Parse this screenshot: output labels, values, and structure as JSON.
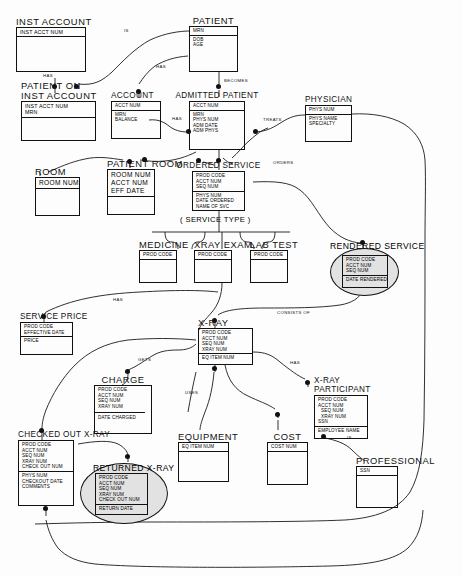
{
  "diagram": {
    "type": "entity-relationship-diagram",
    "service_type_label": "( SERVICE TYPE )"
  },
  "entities": [
    {
      "id": "inst-account",
      "name": "INST ACCOUNT",
      "keys": [
        "INST ACCT NUM"
      ],
      "attributes": []
    },
    {
      "id": "patient-on-inst-account",
      "name": "PATIENT ON INST ACCOUNT",
      "name_line1": "PATIENT ON",
      "name_line2": "INST ACCOUNT",
      "keys": [
        "INST ACCT NUM",
        "MRN"
      ],
      "attributes": []
    },
    {
      "id": "account",
      "name": "ACCOUNT",
      "keys": [
        "ACCT NUM"
      ],
      "attributes": [
        "MRN",
        "BALANCE"
      ]
    },
    {
      "id": "patient",
      "name": "PATIENT",
      "keys": [
        "MRN"
      ],
      "attributes": [
        "DOB",
        "AGE"
      ]
    },
    {
      "id": "admitted-patient",
      "name": "ADMITTED PATIENT",
      "keys": [
        "ACCT NUM"
      ],
      "attributes": [
        "MRN",
        "PHYS NUM",
        "ADM  DATE",
        "ADM  PHYS"
      ]
    },
    {
      "id": "physician",
      "name": "PHYSICIAN",
      "keys": [
        "PHYS NUM"
      ],
      "attributes": [
        "PHYS NAME",
        "SPECIALTY"
      ]
    },
    {
      "id": "room",
      "name": "ROOM",
      "keys": [
        "ROOM  NUM"
      ],
      "attributes": []
    },
    {
      "id": "patient-room",
      "name": "PATIENT ROOM",
      "keys": [
        "ROOM  NUM",
        "ACCT NUM",
        "EFF DATE"
      ],
      "attributes": []
    },
    {
      "id": "ordered-service",
      "name": "ORDERED SERVICE",
      "keys": [
        "PROD CODE",
        "ACCT NUM",
        "SEQ NUM"
      ],
      "attributes": [
        "PHYS NUM",
        "DATE ORDERED",
        "NAME OF SVC"
      ]
    },
    {
      "id": "medicine",
      "name": "MEDICINE",
      "keys": [
        "PROD CODE"
      ],
      "attributes": []
    },
    {
      "id": "xray-exam",
      "name": "XRAY EXAM",
      "keys": [
        "PROD CODE"
      ],
      "attributes": []
    },
    {
      "id": "lab-test",
      "name": "LAB TEST",
      "keys": [
        "PROD CODE"
      ],
      "attributes": []
    },
    {
      "id": "rendered-service",
      "name": "RENDERED SERVICE",
      "keys": [
        "PROD CODE",
        "ACCT NUM",
        "SEQ NUM"
      ],
      "attributes": [
        "DATE RENDERED"
      ],
      "shape": "oval"
    },
    {
      "id": "service-price",
      "name": "SERVICE  PRICE",
      "keys": [
        "PROD CODE",
        "EFFECTIVE DATE"
      ],
      "attributes": [
        "PRICE"
      ]
    },
    {
      "id": "charge",
      "name": "CHARGE",
      "keys": [
        "PROD CODE",
        "ACCT NUM",
        "SEQ NUM",
        "XRAY  NUM"
      ],
      "attributes": [
        "DATE CHARGED"
      ]
    },
    {
      "id": "xray",
      "name": "X-RAY",
      "keys": [
        "PROD CODE",
        "ACCT NUM",
        "SEQ NUM",
        "XRAY  NUM"
      ],
      "attributes": [
        "EQ ITEM NUM"
      ]
    },
    {
      "id": "xray-participant",
      "name": "X-RAY PARTICIPANT",
      "name_line1": "X-RAY",
      "name_line2": "PARTICIPANT",
      "keys": [
        "PROD CODE",
        "ACCT NUM",
        "SEQ NUM",
        "XRAY  NUM",
        "SSN"
      ],
      "attributes": [
        "EMPLOYEE NAME"
      ]
    },
    {
      "id": "checked-out-xray",
      "name": "CHECKED OUT X-RAY",
      "keys": [
        "PROD CODE",
        "ACCT NUM",
        "SEQ NUM",
        "XRAY  NUM",
        "CHECK OUT NUM"
      ],
      "attributes": [
        "PHYS NUM",
        "CHECKOUT DATE",
        "COMMENTS"
      ]
    },
    {
      "id": "returned-xray",
      "name": "RETURNED  X-RAY",
      "keys": [
        "PROD CODE",
        "ACCT NUM",
        "SEQ NUM",
        "XRAY NUM",
        "CHECK OUT NUM"
      ],
      "attributes": [
        "RETURN DATE"
      ],
      "shape": "oval"
    },
    {
      "id": "equipment",
      "name": "EQUIPMENT",
      "keys": [
        "EQ ITEM NUM"
      ],
      "attributes": []
    },
    {
      "id": "cost",
      "name": "COST",
      "keys": [
        "COST NUM"
      ],
      "attributes": []
    },
    {
      "id": "professional",
      "name": "PROFESSIONAL",
      "keys": [
        "SSN"
      ],
      "attributes": []
    }
  ],
  "relationships": [
    {
      "id": "rel-has-inst",
      "label": "HAS"
    },
    {
      "id": "rel-is-patient",
      "label": "IS"
    },
    {
      "id": "rel-has-account",
      "label": "HAS"
    },
    {
      "id": "rel-has-admitted",
      "label": "HAS"
    },
    {
      "id": "rel-becomes",
      "label": "BECOMES"
    },
    {
      "id": "rel-treats",
      "label": "TREATS"
    },
    {
      "id": "rel-orders",
      "label": "ORDERS"
    },
    {
      "id": "rel-has-price",
      "label": "HAS"
    },
    {
      "id": "rel-consists-of",
      "label": "CONSISTS OF"
    },
    {
      "id": "rel-gets",
      "label": "GETS"
    },
    {
      "id": "rel-has-participant",
      "label": "HAS"
    },
    {
      "id": "rel-uses",
      "label": "USES"
    },
    {
      "id": "rel-is-professional",
      "label": "IS"
    }
  ]
}
